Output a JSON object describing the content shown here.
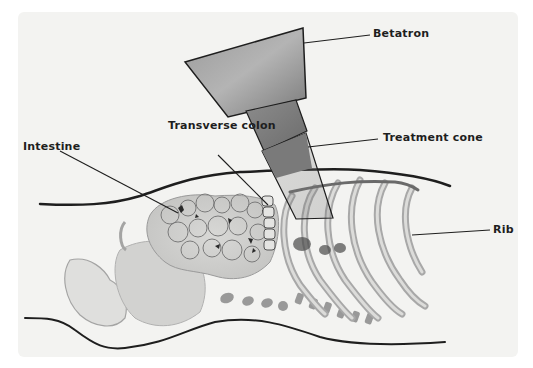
{
  "diagram": {
    "type": "anatomical illustration",
    "labels": [
      {
        "id": "betatron",
        "text": "Betatron"
      },
      {
        "id": "treatment_cone",
        "text": "Treatment cone"
      },
      {
        "id": "transverse_colon",
        "text": "Transverse colon"
      },
      {
        "id": "intestine",
        "text": "Intestine"
      },
      {
        "id": "rib",
        "text": "Rib"
      }
    ],
    "colors": {
      "background": "#f3f3f1",
      "betatron_fill": "#8a8a8a",
      "cone_fill": "#777777",
      "outline": "#1e1e1e",
      "bone": "#b9b9b9"
    }
  }
}
